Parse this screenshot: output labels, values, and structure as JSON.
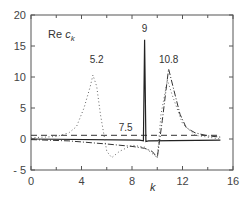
{
  "chart_data": {
    "type": "line",
    "title_main": "Re ",
    "title_var": "c",
    "title_sub": "k",
    "xlabel": "k",
    "ylabel": "",
    "xlim": [
      0,
      16
    ],
    "ylim": [
      -5,
      20
    ],
    "xticks": [
      0,
      4,
      8,
      12,
      16
    ],
    "xtick_labels": [
      "0",
      "4",
      "8",
      "12",
      "16"
    ],
    "yticks": [
      -5,
      0,
      5,
      10,
      15,
      20
    ],
    "ytick_labels": [
      "- 5",
      "0",
      "5",
      "10",
      "15",
      "20"
    ],
    "grid": false,
    "legend": null,
    "annotations": [
      {
        "text": "5.2",
        "x": 5.2,
        "y": 12.3
      },
      {
        "text": "7.5",
        "x": 7.5,
        "y": 1.3
      },
      {
        "text": "9",
        "x": 9.0,
        "y": 17.2
      },
      {
        "text": "10.8",
        "x": 10.9,
        "y": 12.3
      }
    ],
    "series": [
      {
        "name": "7.5",
        "style": "dashed",
        "x": [
          0,
          15
        ],
        "y": [
          0.6,
          0.6
        ]
      },
      {
        "name": "9",
        "style": "solid",
        "x": [
          0,
          8.6,
          8.9,
          9.0,
          9.1,
          9.3,
          15
        ],
        "y": [
          0,
          -0.2,
          -0.3,
          16.0,
          -0.4,
          -0.3,
          -0.2
        ]
      },
      {
        "name": "5.2",
        "style": "dotted",
        "x": [
          0,
          2,
          3,
          3.6,
          4.2,
          4.7,
          4.9,
          5.2,
          5.5,
          6.0,
          6.4,
          7.0,
          8.0,
          9.0,
          9.5,
          10.0,
          10.3,
          10.8,
          11.2,
          12,
          13,
          15
        ],
        "y": [
          0.2,
          0.4,
          1.0,
          2.0,
          5.0,
          8.5,
          10.3,
          8.5,
          4.0,
          -2.0,
          -3.0,
          -2.0,
          -1.0,
          -1.3,
          -2.2,
          -3.0,
          4.0,
          9.5,
          7.0,
          2.5,
          0.6,
          0.0
        ]
      },
      {
        "name": "10.8",
        "style": "dash-dot",
        "x": [
          0,
          3,
          6,
          8,
          9,
          9.6,
          10.0,
          10.4,
          10.9,
          11.3,
          11.8,
          12.3,
          13,
          14,
          15
        ],
        "y": [
          -0.1,
          -0.3,
          -0.8,
          -1.2,
          -1.5,
          -2.0,
          -3.0,
          3.0,
          11.3,
          8.0,
          4.0,
          1.8,
          1.0,
          0.5,
          0.3
        ]
      }
    ]
  }
}
